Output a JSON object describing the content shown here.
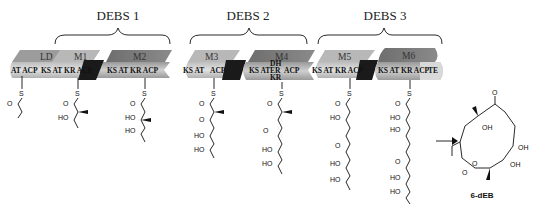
{
  "diagram": {
    "groups": [
      {
        "label": "DEBS 1",
        "modules": [
          "LD",
          "M1",
          "M2"
        ]
      },
      {
        "label": "DEBS 2",
        "modules": [
          "M3",
          "M4"
        ]
      },
      {
        "label": "DEBS 3",
        "modules": [
          "M5",
          "M6"
        ]
      }
    ],
    "modules": {
      "LD": {
        "label": "LD",
        "domains": "AT ACP"
      },
      "M1": {
        "label": "M1",
        "domains": "KS AT KR ACP"
      },
      "M2": {
        "label": "M2",
        "domains": "KS AT KR ACP"
      },
      "M3": {
        "label": "M3",
        "domains_a": "KS AT",
        "domains_b": "ACP"
      },
      "M4": {
        "label": "M4",
        "domains_a": "KS AT",
        "dh": "DH",
        "er": "ER",
        "kr": "KR",
        "acp": "ACP"
      },
      "M5": {
        "label": "M5",
        "domains": "KS AT KR ACP"
      },
      "M6": {
        "label": "M6",
        "domains": "KS AT KR ACP",
        "te": "TE"
      }
    },
    "chem_labels": {
      "s": "S",
      "o": "O",
      "ho": "HO",
      "oh": "OH"
    },
    "product": {
      "label": "6-dEB"
    },
    "colors": {
      "bar_light": "#c8c8c8",
      "bar_mid": "#a9a9a9",
      "bar_dark": "#7a7a7a",
      "linker": "#1a1a1a"
    }
  }
}
